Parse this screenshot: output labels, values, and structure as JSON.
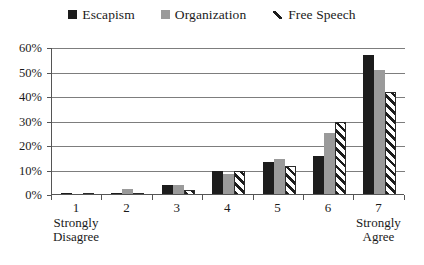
{
  "legend": {
    "position": "top-center",
    "items": [
      {
        "label": "Escapism",
        "marker": "filled-square-black",
        "color": "#1c1c1c"
      },
      {
        "label": "Organization",
        "marker": "filled-square-gray",
        "color": "#9a9a9a"
      },
      {
        "label": "Free Speech",
        "marker": "diagonal-hatch",
        "color": "#1c1c1c"
      }
    ]
  },
  "yaxis": {
    "ticks": [
      "0%",
      "10%",
      "20%",
      "30%",
      "40%",
      "50%",
      "60%"
    ],
    "min": 0,
    "max": 60,
    "step": 10
  },
  "xaxis": {
    "categories": [
      {
        "num": "1",
        "sub1": "Strongly",
        "sub2": "Disagree"
      },
      {
        "num": "2",
        "sub1": "",
        "sub2": ""
      },
      {
        "num": "3",
        "sub1": "",
        "sub2": ""
      },
      {
        "num": "4",
        "sub1": "",
        "sub2": ""
      },
      {
        "num": "5",
        "sub1": "",
        "sub2": ""
      },
      {
        "num": "6",
        "sub1": "",
        "sub2": ""
      },
      {
        "num": "7",
        "sub1": "Strongly",
        "sub2": "Agree"
      }
    ]
  },
  "chart_data": {
    "type": "bar",
    "title": "",
    "subtitle": "",
    "xlabel": "",
    "ylabel": "",
    "ylim": [
      0,
      60
    ],
    "ytick_step": 10,
    "ytick_labels": [
      "0%",
      "10%",
      "20%",
      "30%",
      "40%",
      "50%",
      "60%"
    ],
    "grid": true,
    "grid_axis": "y",
    "legend_position": "top-center",
    "categories": [
      "1",
      "2",
      "3",
      "4",
      "5",
      "6",
      "7"
    ],
    "category_annotations": {
      "1": "Strongly Disagree",
      "7": "Strongly Agree"
    },
    "series": [
      {
        "name": "Escapism",
        "color": "#1c1c1c",
        "pattern": "solid",
        "values": [
          0.8,
          0.8,
          4.0,
          10.0,
          13.5,
          16.0,
          57.0
        ]
      },
      {
        "name": "Organization",
        "color": "#9a9a9a",
        "pattern": "solid",
        "values": [
          0.5,
          2.5,
          4.0,
          8.5,
          14.5,
          25.5,
          51.0
        ]
      },
      {
        "name": "Free Speech",
        "color": "#1c1c1c",
        "pattern": "diagonal-hatch",
        "values": [
          0.3,
          0.5,
          2.0,
          10.0,
          12.0,
          30.0,
          42.0
        ]
      }
    ],
    "units": "percent"
  }
}
